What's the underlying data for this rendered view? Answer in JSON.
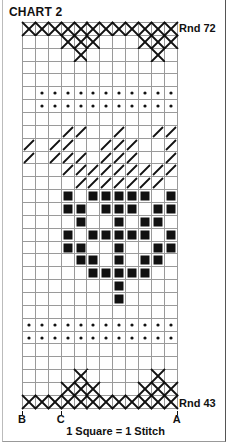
{
  "title": "CHART 2",
  "top_round_label": "Rnd 72",
  "bottom_round_label": "Rnd 43",
  "column_markers": [
    {
      "label": "B",
      "col_boundary": 0
    },
    {
      "label": "C",
      "col_boundary": 3
    },
    {
      "label": "A",
      "col_boundary": 12
    }
  ],
  "legend": "1 Square = 1 Stitch",
  "grid": {
    "columns": 12,
    "rows_top_to_bottom": [
      {
        "rnd": 72,
        "cross": [
          0,
          1,
          2,
          3,
          4,
          5,
          6,
          7,
          8,
          9,
          10,
          11
        ]
      },
      {
        "rnd": 71,
        "cross": [
          3,
          4,
          5,
          9,
          10,
          11
        ]
      },
      {
        "rnd": 70,
        "cross": [
          4,
          10
        ]
      },
      {
        "rnd": 69
      },
      {
        "rnd": 68
      },
      {
        "rnd": 67,
        "dot": [
          1,
          2,
          3,
          4,
          5,
          6,
          7,
          8,
          9,
          10,
          11
        ]
      },
      {
        "rnd": 66,
        "dot": [
          1,
          2,
          3,
          4,
          5,
          6,
          7,
          8,
          9,
          10,
          11
        ]
      },
      {
        "rnd": 65
      },
      {
        "rnd": 64,
        "slash": [
          3,
          4,
          7,
          10,
          11
        ]
      },
      {
        "rnd": 63,
        "slash": [
          0,
          2,
          3,
          6,
          7,
          8,
          11
        ]
      },
      {
        "rnd": 62,
        "slash": [
          0,
          2,
          3,
          4,
          6,
          7,
          8,
          11
        ]
      },
      {
        "rnd": 61,
        "slash": [
          3,
          4,
          5,
          6,
          7,
          8,
          9,
          10,
          11
        ]
      },
      {
        "rnd": 60,
        "slash": [
          4,
          5,
          6,
          7,
          8,
          9,
          10
        ]
      },
      {
        "rnd": 59,
        "solid": [
          3,
          5,
          6,
          7,
          8,
          9,
          11
        ]
      },
      {
        "rnd": 58,
        "solid": [
          3,
          4,
          6,
          7,
          8,
          10,
          11
        ]
      },
      {
        "rnd": 57,
        "solid": [
          4,
          7,
          9,
          10
        ]
      },
      {
        "rnd": 56,
        "solid": [
          3,
          5,
          6,
          7,
          8,
          9,
          11
        ]
      },
      {
        "rnd": 55,
        "solid": [
          3,
          4,
          7,
          10,
          11
        ]
      },
      {
        "rnd": 54,
        "solid": [
          4,
          5,
          7,
          9,
          10
        ]
      },
      {
        "rnd": 53,
        "solid": [
          5,
          6,
          7,
          8,
          9
        ]
      },
      {
        "rnd": 52,
        "solid": [
          7
        ]
      },
      {
        "rnd": 51,
        "solid": [
          7
        ]
      },
      {
        "rnd": 50
      },
      {
        "rnd": 49,
        "dot": [
          0,
          1,
          2,
          3,
          4,
          5,
          6,
          7,
          8,
          9,
          10,
          11
        ]
      },
      {
        "rnd": 48,
        "dot": [
          0,
          1,
          2,
          3,
          4,
          5,
          6,
          7,
          8,
          9,
          10,
          11
        ]
      },
      {
        "rnd": 47
      },
      {
        "rnd": 46
      },
      {
        "rnd": 45,
        "cross": [
          4,
          10
        ]
      },
      {
        "rnd": 44,
        "cross": [
          3,
          4,
          5,
          9,
          10,
          11
        ]
      },
      {
        "rnd": 43,
        "cross": [
          0,
          1,
          2,
          3,
          4,
          5,
          6,
          7,
          8,
          9,
          10,
          11
        ]
      }
    ]
  },
  "symbol_legend": {
    "cross": "x-stitch-icon",
    "dot": "dot-stitch-icon",
    "slash": "slash-stitch-icon",
    "solid": "solid-square-icon"
  },
  "colors": {
    "ink": "#111111",
    "gridline": "#9a9a9a",
    "background": "#ffffff"
  }
}
